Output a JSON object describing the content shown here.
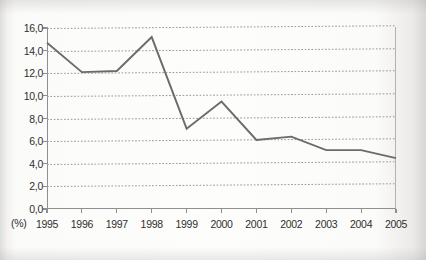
{
  "chart_data": {
    "type": "line",
    "title": "",
    "xlabel": "",
    "ylabel": "",
    "unit_label": "(%)",
    "categories": [
      "1995",
      "1996",
      "1997",
      "1998",
      "1999",
      "2000",
      "2001",
      "2002",
      "2003",
      "2004",
      "2005"
    ],
    "values": [
      14.7,
      12.1,
      12.2,
      15.2,
      7.1,
      9.5,
      6.1,
      6.4,
      5.2,
      5.2,
      4.5
    ],
    "series": [
      {
        "name": "",
        "values": [
          14.7,
          12.1,
          12.2,
          15.2,
          7.1,
          9.5,
          6.1,
          6.4,
          5.2,
          5.2,
          4.5
        ]
      }
    ],
    "ylim": [
      0.0,
      16.0
    ],
    "ytick_step": 2.0,
    "ytick_labels": [
      "16,0",
      "14,0",
      "12,0",
      "10,0",
      "8,0",
      "6,0",
      "4,0",
      "2,0",
      "0,0"
    ],
    "ytick_values": [
      16.0,
      14.0,
      12.0,
      10.0,
      8.0,
      6.0,
      4.0,
      2.0,
      0.0
    ],
    "grid": true,
    "grid_style": "dotted-horizontal",
    "legend": "none",
    "line_color": "#6b6b6b",
    "grid_color": "#9a9a98",
    "axis_color": "#8f8f8f",
    "background_color": "#fbfbfa",
    "annotations": []
  }
}
